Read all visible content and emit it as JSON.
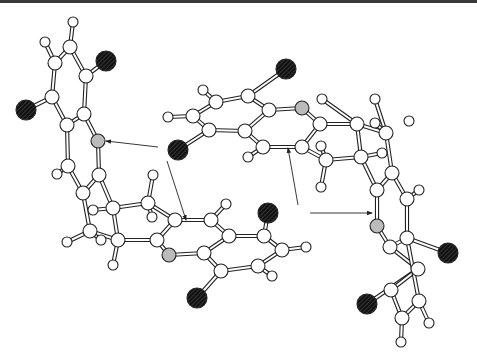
{
  "diagram": {
    "type": "ball-and-stick molecular structure",
    "legend": {
      "white": "C/H atom",
      "black_hatched": "O atom",
      "grey_hatched": "N atom"
    },
    "colors": {
      "background": "#ffffff",
      "bond_outline": "#222222",
      "carbon_fill": "#ffffff",
      "oxygen_fill": "#1a1a1a",
      "nitrogen_fill": "#bdbdbd",
      "top_border": "#3a3a3a"
    },
    "atoms": [
      {
        "id": "h1",
        "x": 73,
        "y": 22,
        "r": 5,
        "el": "H"
      },
      {
        "id": "c1",
        "x": 70,
        "y": 47,
        "r": 7,
        "el": "C"
      },
      {
        "id": "h2",
        "x": 45,
        "y": 42,
        "r": 5,
        "el": "H"
      },
      {
        "id": "c2",
        "x": 55,
        "y": 63,
        "r": 7,
        "el": "C"
      },
      {
        "id": "o1",
        "x": 106,
        "y": 61,
        "r": 10,
        "el": "O"
      },
      {
        "id": "c3",
        "x": 86,
        "y": 76,
        "r": 7,
        "el": "C"
      },
      {
        "id": "c4",
        "x": 52,
        "y": 97,
        "r": 7,
        "el": "C"
      },
      {
        "id": "o2",
        "x": 26,
        "y": 110,
        "r": 10,
        "el": "O"
      },
      {
        "id": "c5",
        "x": 84,
        "y": 114,
        "r": 7,
        "el": "C"
      },
      {
        "id": "c6",
        "x": 67,
        "y": 125,
        "r": 7,
        "el": "C"
      },
      {
        "id": "n1",
        "x": 98,
        "y": 141,
        "r": 7,
        "el": "N"
      },
      {
        "id": "c7",
        "x": 68,
        "y": 166,
        "r": 7,
        "el": "C"
      },
      {
        "id": "h3",
        "x": 57,
        "y": 174,
        "r": 5,
        "el": "H"
      },
      {
        "id": "c8",
        "x": 99,
        "y": 175,
        "r": 7,
        "el": "C"
      },
      {
        "id": "c9",
        "x": 83,
        "y": 193,
        "r": 7,
        "el": "C"
      },
      {
        "id": "h4",
        "x": 153,
        "y": 175,
        "r": 5,
        "el": "H"
      },
      {
        "id": "c10",
        "x": 113,
        "y": 208,
        "r": 7,
        "el": "C"
      },
      {
        "id": "h5",
        "x": 93,
        "y": 210,
        "r": 5,
        "el": "H"
      },
      {
        "id": "c11",
        "x": 148,
        "y": 203,
        "r": 7,
        "el": "C"
      },
      {
        "id": "h6",
        "x": 152,
        "y": 217,
        "r": 5,
        "el": "H"
      },
      {
        "id": "c12",
        "x": 90,
        "y": 231,
        "r": 7,
        "el": "C"
      },
      {
        "id": "h7",
        "x": 67,
        "y": 242,
        "r": 5,
        "el": "H"
      },
      {
        "id": "h8",
        "x": 101,
        "y": 240,
        "r": 5,
        "el": "H"
      },
      {
        "id": "c13",
        "x": 118,
        "y": 240,
        "r": 7,
        "el": "C"
      },
      {
        "id": "h9",
        "x": 113,
        "y": 265,
        "r": 5,
        "el": "H"
      },
      {
        "id": "c14",
        "x": 157,
        "y": 240,
        "r": 7,
        "el": "C"
      },
      {
        "id": "c15",
        "x": 175,
        "y": 220,
        "r": 7,
        "el": "C"
      },
      {
        "id": "n2",
        "x": 169,
        "y": 255,
        "r": 7,
        "el": "N"
      },
      {
        "id": "c16",
        "x": 211,
        "y": 220,
        "r": 7,
        "el": "C"
      },
      {
        "id": "h10",
        "x": 226,
        "y": 204,
        "r": 5,
        "el": "H"
      },
      {
        "id": "c17",
        "x": 229,
        "y": 236,
        "r": 7,
        "el": "C"
      },
      {
        "id": "c18",
        "x": 204,
        "y": 253,
        "r": 7,
        "el": "C"
      },
      {
        "id": "o3",
        "x": 268,
        "y": 213,
        "r": 10,
        "el": "O"
      },
      {
        "id": "c19",
        "x": 264,
        "y": 236,
        "r": 7,
        "el": "C"
      },
      {
        "id": "c20",
        "x": 282,
        "y": 250,
        "r": 7,
        "el": "C"
      },
      {
        "id": "h11",
        "x": 306,
        "y": 247,
        "r": 5,
        "el": "H"
      },
      {
        "id": "c21",
        "x": 221,
        "y": 271,
        "r": 7,
        "el": "C"
      },
      {
        "id": "c22",
        "x": 258,
        "y": 266,
        "r": 7,
        "el": "C"
      },
      {
        "id": "h12",
        "x": 272,
        "y": 276,
        "r": 5,
        "el": "H"
      },
      {
        "id": "o4",
        "x": 197,
        "y": 298,
        "r": 10,
        "el": "O"
      },
      {
        "id": "o5",
        "x": 286,
        "y": 69,
        "r": 10,
        "el": "O"
      },
      {
        "id": "h13",
        "x": 203,
        "y": 90,
        "r": 5,
        "el": "H"
      },
      {
        "id": "c23",
        "x": 216,
        "y": 102,
        "r": 7,
        "el": "C"
      },
      {
        "id": "c24",
        "x": 248,
        "y": 96,
        "r": 7,
        "el": "C"
      },
      {
        "id": "h14",
        "x": 168,
        "y": 117,
        "r": 5,
        "el": "H"
      },
      {
        "id": "c25",
        "x": 193,
        "y": 116,
        "r": 7,
        "el": "C"
      },
      {
        "id": "c26",
        "x": 269,
        "y": 110,
        "r": 7,
        "el": "C"
      },
      {
        "id": "n3",
        "x": 302,
        "y": 108,
        "r": 7,
        "el": "N"
      },
      {
        "id": "c27",
        "x": 209,
        "y": 130,
        "r": 7,
        "el": "C"
      },
      {
        "id": "c28",
        "x": 245,
        "y": 131,
        "r": 7,
        "el": "C"
      },
      {
        "id": "o6",
        "x": 178,
        "y": 150,
        "r": 10,
        "el": "O"
      },
      {
        "id": "c29",
        "x": 320,
        "y": 124,
        "r": 7,
        "el": "C"
      },
      {
        "id": "c30",
        "x": 263,
        "y": 147,
        "r": 7,
        "el": "C"
      },
      {
        "id": "h15",
        "x": 248,
        "y": 157,
        "r": 5,
        "el": "H"
      },
      {
        "id": "c31",
        "x": 302,
        "y": 147,
        "r": 7,
        "el": "C"
      },
      {
        "id": "h16",
        "x": 322,
        "y": 99,
        "r": 5,
        "el": "H"
      },
      {
        "id": "c32",
        "x": 357,
        "y": 124,
        "r": 7,
        "el": "C"
      },
      {
        "id": "h17",
        "x": 375,
        "y": 99,
        "r": 5,
        "el": "H"
      },
      {
        "id": "h18",
        "x": 375,
        "y": 123,
        "r": 5,
        "el": "H"
      },
      {
        "id": "c33",
        "x": 386,
        "y": 133,
        "r": 7,
        "el": "C"
      },
      {
        "id": "h19",
        "x": 409,
        "y": 121,
        "r": 5,
        "el": "H"
      },
      {
        "id": "h20",
        "x": 321,
        "y": 146,
        "r": 5,
        "el": "H"
      },
      {
        "id": "c34",
        "x": 326,
        "y": 160,
        "r": 7,
        "el": "C"
      },
      {
        "id": "c35",
        "x": 361,
        "y": 157,
        "r": 7,
        "el": "C"
      },
      {
        "id": "h21",
        "x": 382,
        "y": 153,
        "r": 5,
        "el": "H"
      },
      {
        "id": "h22",
        "x": 321,
        "y": 187,
        "r": 5,
        "el": "H"
      },
      {
        "id": "c36",
        "x": 392,
        "y": 173,
        "r": 7,
        "el": "C"
      },
      {
        "id": "c37",
        "x": 377,
        "y": 190,
        "r": 7,
        "el": "C"
      },
      {
        "id": "h23",
        "x": 419,
        "y": 190,
        "r": 5,
        "el": "H"
      },
      {
        "id": "c38",
        "x": 407,
        "y": 199,
        "r": 7,
        "el": "C"
      },
      {
        "id": "n4",
        "x": 377,
        "y": 226,
        "r": 7,
        "el": "N"
      },
      {
        "id": "c39",
        "x": 390,
        "y": 247,
        "r": 7,
        "el": "C"
      },
      {
        "id": "c40",
        "x": 407,
        "y": 238,
        "r": 7,
        "el": "C"
      },
      {
        "id": "o7",
        "x": 448,
        "y": 253,
        "r": 10,
        "el": "O"
      },
      {
        "id": "c41",
        "x": 418,
        "y": 269,
        "r": 7,
        "el": "C"
      },
      {
        "id": "c42",
        "x": 391,
        "y": 290,
        "r": 7,
        "el": "C"
      },
      {
        "id": "o8",
        "x": 367,
        "y": 304,
        "r": 10,
        "el": "O"
      },
      {
        "id": "c43",
        "x": 419,
        "y": 301,
        "r": 7,
        "el": "C"
      },
      {
        "id": "h24",
        "x": 429,
        "y": 323,
        "r": 5,
        "el": "H"
      },
      {
        "id": "c44",
        "x": 402,
        "y": 318,
        "r": 7,
        "el": "C"
      },
      {
        "id": "h25",
        "x": 401,
        "y": 342,
        "r": 5,
        "el": "H"
      }
    ],
    "bonds": [
      [
        "h1",
        "c1"
      ],
      [
        "c1",
        "c3"
      ],
      [
        "c1",
        "c2"
      ],
      [
        "h2",
        "c2"
      ],
      [
        "c2",
        "c4"
      ],
      [
        "c3",
        "o1"
      ],
      [
        "c3",
        "c5"
      ],
      [
        "c4",
        "o2"
      ],
      [
        "c4",
        "c6"
      ],
      [
        "c5",
        "c6"
      ],
      [
        "c5",
        "n1"
      ],
      [
        "c6",
        "c7"
      ],
      [
        "n1",
        "c8"
      ],
      [
        "c7",
        "h3"
      ],
      [
        "c7",
        "c9"
      ],
      [
        "c8",
        "c9"
      ],
      [
        "c8",
        "c10"
      ],
      [
        "c9",
        "c12"
      ],
      [
        "c10",
        "c11"
      ],
      [
        "c10",
        "h5"
      ],
      [
        "c10",
        "c13"
      ],
      [
        "c11",
        "h4"
      ],
      [
        "c11",
        "h6"
      ],
      [
        "c11",
        "c15"
      ],
      [
        "c12",
        "h7"
      ],
      [
        "c12",
        "h8"
      ],
      [
        "c12",
        "c13"
      ],
      [
        "c13",
        "h9"
      ],
      [
        "c13",
        "c14"
      ],
      [
        "c14",
        "c15"
      ],
      [
        "c14",
        "n2"
      ],
      [
        "c15",
        "c16"
      ],
      [
        "c16",
        "h10"
      ],
      [
        "c16",
        "c17"
      ],
      [
        "n2",
        "c18"
      ],
      [
        "c17",
        "c18"
      ],
      [
        "c17",
        "c19"
      ],
      [
        "c18",
        "c21"
      ],
      [
        "c19",
        "o3"
      ],
      [
        "c19",
        "c20"
      ],
      [
        "c20",
        "h11"
      ],
      [
        "c20",
        "c22"
      ],
      [
        "c21",
        "c22"
      ],
      [
        "c22",
        "h12"
      ],
      [
        "c21",
        "o4"
      ],
      [
        "o5",
        "c24"
      ],
      [
        "h13",
        "c23"
      ],
      [
        "c23",
        "c24"
      ],
      [
        "c23",
        "c25"
      ],
      [
        "c24",
        "c26"
      ],
      [
        "h14",
        "c25"
      ],
      [
        "c25",
        "c27"
      ],
      [
        "c26",
        "n3"
      ],
      [
        "c26",
        "c28"
      ],
      [
        "c27",
        "c28"
      ],
      [
        "c27",
        "o6"
      ],
      [
        "n3",
        "c29"
      ],
      [
        "c28",
        "c30"
      ],
      [
        "c30",
        "h15"
      ],
      [
        "c30",
        "c31"
      ],
      [
        "c29",
        "c31"
      ],
      [
        "c29",
        "c32"
      ],
      [
        "c31",
        "c34"
      ],
      [
        "c32",
        "h16"
      ],
      [
        "c32",
        "c33"
      ],
      [
        "c32",
        "c35"
      ],
      [
        "c33",
        "h17"
      ],
      [
        "c33",
        "h18"
      ],
      [
        "c33",
        "c36"
      ],
      [
        "c34",
        "h20"
      ],
      [
        "c34",
        "h22"
      ],
      [
        "c34",
        "c35"
      ],
      [
        "c35",
        "h21"
      ],
      [
        "c35",
        "c37"
      ],
      [
        "c36",
        "c38"
      ],
      [
        "c36",
        "c37"
      ],
      [
        "c38",
        "h23"
      ],
      [
        "c37",
        "n4"
      ],
      [
        "c38",
        "c40"
      ],
      [
        "n4",
        "c39"
      ],
      [
        "c39",
        "c40"
      ],
      [
        "c40",
        "o7"
      ],
      [
        "c39",
        "c41"
      ],
      [
        "c41",
        "o8"
      ],
      [
        "c41",
        "c42"
      ],
      [
        "c40",
        "c43"
      ],
      [
        "c42",
        "c44"
      ],
      [
        "c43",
        "c44"
      ],
      [
        "c43",
        "h24"
      ],
      [
        "c44",
        "h25"
      ]
    ],
    "arrows": [
      {
        "from": [
          158,
          147
        ],
        "to": [
          106,
          141
        ]
      },
      {
        "from": [
          167,
          161
        ],
        "to": [
          186,
          220
        ]
      },
      {
        "from": [
          298,
          205
        ],
        "to": [
          288,
          148
        ]
      },
      {
        "from": [
          310,
          213
        ],
        "to": [
          372,
          213
        ]
      }
    ]
  }
}
